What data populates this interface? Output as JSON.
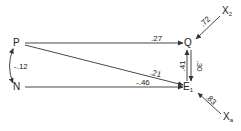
{
  "diagram": {
    "type": "path-diagram",
    "colors": {
      "line": "#333333",
      "text": "#222222",
      "background": "#ffffff"
    },
    "nodes": {
      "P": {
        "label": "P"
      },
      "N": {
        "label": "N"
      },
      "Q": {
        "label": "Q"
      },
      "E": {
        "label": "E",
        "subscript": "1"
      },
      "X2": {
        "label": "X",
        "subscript": "2"
      },
      "Xa": {
        "label": "X",
        "subscript": "a"
      }
    },
    "edges": [
      {
        "from": "P",
        "to": "Q",
        "coefficient": ".27"
      },
      {
        "from": "P",
        "to": "E1",
        "coefficient": ".21"
      },
      {
        "from": "N",
        "to": "E1",
        "coefficient": "-.46"
      },
      {
        "from": "P",
        "to": "N",
        "coefficient": "-.12",
        "bidirectional": true
      },
      {
        "from": "E1",
        "to": "Q",
        "coefficient": ".41"
      },
      {
        "from": "Q",
        "to": "E1",
        "coefficient": ".30"
      },
      {
        "from": "X2",
        "to": "Q",
        "coefficient": ".72"
      },
      {
        "from": "Xa",
        "to": "E1",
        "coefficient": ".83"
      }
    ],
    "coef_labels": {
      "pq": ".27",
      "pe": ".21",
      "ne": "-.46",
      "pn": "-.12",
      "eq": ".41",
      "qe": ".30",
      "x2q": ".72",
      "xae": ".83"
    }
  }
}
